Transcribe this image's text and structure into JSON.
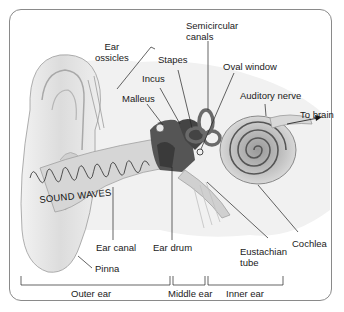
{
  "diagram": {
    "labels": {
      "ear_ossicles_line1": "Ear",
      "ear_ossicles_line2": "ossicles",
      "stapes": "Stapes",
      "incus": "Incus",
      "malleus": "Malleus",
      "semicircular_line1": "Semicircular",
      "semicircular_line2": "canals",
      "oval_window": "Oval window",
      "auditory_nerve": "Auditory nerve",
      "to_brain": "To brain",
      "sound_waves": "SOUND WAVES",
      "ear_canal": "Ear canal",
      "ear_drum": "Ear drum",
      "eustachian_line1": "Eustachian",
      "eustachian_line2": "tube",
      "cochlea": "Cochlea",
      "pinna": "Pinna"
    },
    "regions": [
      {
        "label": "Outer ear"
      },
      {
        "label": "Middle ear"
      },
      {
        "label": "Inner ear"
      }
    ],
    "colors": {
      "frame": "#8a8a8a",
      "tissue_light": "#e6e6e6",
      "tissue_mid": "#bdbdbd",
      "tissue_dark": "#4a4a4a",
      "line": "#222222"
    }
  }
}
